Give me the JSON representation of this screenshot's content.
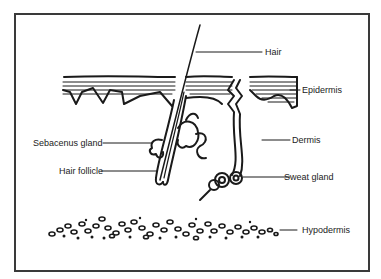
{
  "diagram": {
    "type": "anatomical cross-section",
    "labels": {
      "hair": "Hair",
      "epidermis": "Epidermis",
      "dermis": "Dermis",
      "sebaceous_gland": "Sebacenus gland",
      "hair_follicle": "Hair follicle",
      "sweat_gland": "Sweat gland",
      "hypodermis": "Hypodermis"
    },
    "colors": {
      "ink": "#1a1a1a",
      "frame": "#3a3a3a",
      "background": "#ffffff"
    }
  }
}
